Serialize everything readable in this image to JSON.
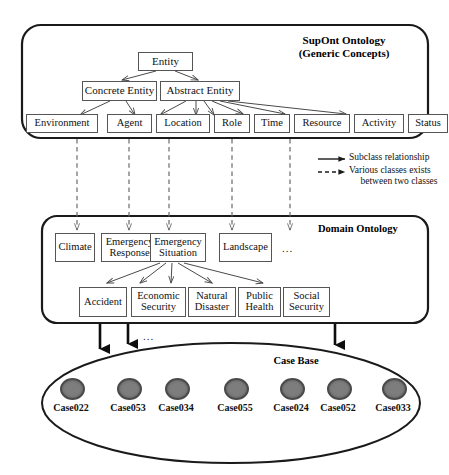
{
  "diagram": {
    "title_note": "Ontology and case base layered diagram"
  },
  "supont": {
    "title_line1": "SupOnt Ontology",
    "title_line2": "(Generic Concepts)",
    "root": {
      "label": "Entity"
    },
    "level2": [
      {
        "label": "Concrete Entity"
      },
      {
        "label": "Abstract Entity"
      }
    ],
    "level3": [
      {
        "label": "Environment"
      },
      {
        "label": "Agent"
      },
      {
        "label": "Location"
      },
      {
        "label": "Role"
      },
      {
        "label": "Time"
      },
      {
        "label": "Resource"
      },
      {
        "label": "Activity"
      },
      {
        "label": "Status"
      }
    ]
  },
  "legend": {
    "solid_label": "Subclass relationship",
    "dashed_label_line1": "Various classes exists",
    "dashed_label_line2": "between two classes"
  },
  "domain": {
    "title": "Domain Ontology",
    "row1": [
      {
        "label": "Climate"
      },
      {
        "label": "Emergency Response"
      },
      {
        "label": "Emergency Situation"
      },
      {
        "label": "Landscape"
      }
    ],
    "row1_ellipsis": "...",
    "row2": [
      {
        "label": "Accident"
      },
      {
        "label": "Economic Security"
      },
      {
        "label": "Natural Disaster"
      },
      {
        "label": "Public Health"
      },
      {
        "label": "Social Security"
      }
    ]
  },
  "case_base": {
    "title": "Case Base",
    "ellipsis": "...",
    "cases": [
      {
        "label": "Case022"
      },
      {
        "label": "Case053"
      },
      {
        "label": "Case034"
      },
      {
        "label": "Case055"
      },
      {
        "label": "Case024"
      },
      {
        "label": "Case052"
      },
      {
        "label": "Case033"
      }
    ]
  },
  "colors": {
    "stroke": "#555555",
    "heavy_stroke": "#1a1a1a",
    "dot_fill": "#7d7d7d",
    "dot_border": "#4a4a4a",
    "background": "#ffffff"
  }
}
